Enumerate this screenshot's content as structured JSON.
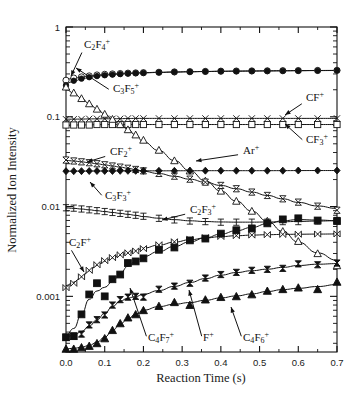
{
  "figure": {
    "background": "#ffffff",
    "ink": "#111111",
    "width": 361,
    "height": 400
  },
  "axes": {
    "x_title": "Reaction Time (s)",
    "y_title": "Normalized Ion Intensity",
    "x_ticklabels": [
      "0.0",
      "0.1",
      "0.2",
      "0.3",
      "0.4",
      "0.5",
      "0.6",
      "0.7"
    ],
    "x_tickvalues": [
      0.0,
      0.1,
      0.2,
      0.3,
      0.4,
      0.5,
      0.6,
      0.7
    ],
    "y_ticklabels": [
      "1",
      "0.1",
      "0.01",
      "0.001"
    ],
    "y_tickvalues": [
      1,
      0.1,
      0.01,
      0.001
    ]
  },
  "chart_data": {
    "type": "scatter",
    "title": "",
    "subtitle": "",
    "xlabel": "Reaction Time (s)",
    "ylabel": "Normalized Ion Intensity",
    "xscale": "linear",
    "yscale": "log",
    "xlim": [
      0.0,
      0.7
    ],
    "ylim": [
      0.00024,
      1.0
    ],
    "grid": false,
    "legend": "none (in-plot annotated labels with leader lines)",
    "annotations": [
      {
        "text": "C2F4+",
        "display": "C₂F₄⁺",
        "points_to_series": "C2F4+"
      },
      {
        "text": "C3F5+",
        "display": "C₃F₅⁺",
        "points_to_series": "C3F5+"
      },
      {
        "text": "CF+",
        "display": "CF⁺",
        "points_to_series": "CF+"
      },
      {
        "text": "CF3+",
        "display": "CF₃⁺",
        "points_to_series": "CF3+"
      },
      {
        "text": "Ar+",
        "display": "Ar⁺",
        "points_to_series": "Ar+"
      },
      {
        "text": "CF2+",
        "display": "CF₂⁺",
        "points_to_series": "CF2+"
      },
      {
        "text": "C3F3+",
        "display": "C₃F₃⁺",
        "points_to_series": "C3F3+"
      },
      {
        "text": "C2F3+",
        "display": "C₂F₃⁺",
        "points_to_series": "C2F3+"
      },
      {
        "text": "C2F+",
        "display": "C₂F⁺",
        "points_to_series": "C2F+"
      },
      {
        "text": "C4F7+",
        "display": "C₄F₇⁺",
        "points_to_series": "C4F7+"
      },
      {
        "text": "F+",
        "display": "F⁺",
        "points_to_series": "F+"
      },
      {
        "text": "C4F6+",
        "display": "C₄F₆⁺",
        "points_to_series": "C4F6+"
      }
    ],
    "series": [
      {
        "name": "C2F4+",
        "label": "C₂F₄⁺",
        "marker": "open-circle",
        "x": [
          0.0,
          0.02,
          0.04,
          0.06,
          0.08,
          0.1,
          0.12,
          0.14,
          0.16,
          0.18,
          0.2,
          0.24,
          0.28,
          0.32,
          0.36,
          0.4,
          0.44,
          0.48,
          0.52,
          0.56,
          0.6,
          0.65,
          0.7
        ],
        "y": [
          0.255,
          0.27,
          0.278,
          0.285,
          0.292,
          0.297,
          0.3,
          0.303,
          0.306,
          0.308,
          0.31,
          0.313,
          0.316,
          0.318,
          0.32,
          0.322,
          0.323,
          0.324,
          0.325,
          0.326,
          0.327,
          0.328,
          0.329
        ]
      },
      {
        "name": "C3F5+",
        "label": "C₃F₅⁺",
        "marker": "filled-circle",
        "x": [
          0.0,
          0.02,
          0.04,
          0.06,
          0.08,
          0.1,
          0.12,
          0.14,
          0.16,
          0.18,
          0.2,
          0.24,
          0.28,
          0.32,
          0.36,
          0.4,
          0.44,
          0.48,
          0.52,
          0.56,
          0.6,
          0.65,
          0.7
        ],
        "y": [
          0.225,
          0.252,
          0.266,
          0.276,
          0.284,
          0.29,
          0.295,
          0.299,
          0.303,
          0.306,
          0.308,
          0.312,
          0.315,
          0.317,
          0.319,
          0.321,
          0.322,
          0.323,
          0.324,
          0.325,
          0.326,
          0.327,
          0.328
        ]
      },
      {
        "name": "CF+",
        "label": "CF⁺",
        "marker": "x-cross",
        "x": [
          0.0,
          0.02,
          0.04,
          0.06,
          0.08,
          0.1,
          0.12,
          0.14,
          0.16,
          0.18,
          0.2,
          0.24,
          0.28,
          0.32,
          0.36,
          0.4,
          0.44,
          0.48,
          0.52,
          0.56,
          0.6,
          0.65,
          0.7
        ],
        "y": [
          0.094,
          0.094,
          0.094,
          0.095,
          0.095,
          0.095,
          0.095,
          0.095,
          0.096,
          0.096,
          0.096,
          0.096,
          0.096,
          0.096,
          0.096,
          0.096,
          0.096,
          0.096,
          0.096,
          0.096,
          0.096,
          0.096,
          0.096
        ]
      },
      {
        "name": "CF3+",
        "label": "CF₃⁺",
        "marker": "open-square",
        "x": [
          0.0,
          0.02,
          0.04,
          0.06,
          0.08,
          0.1,
          0.12,
          0.14,
          0.16,
          0.18,
          0.2,
          0.24,
          0.28,
          0.32,
          0.36,
          0.4,
          0.44,
          0.48,
          0.52,
          0.56,
          0.6,
          0.65,
          0.7
        ],
        "y": [
          0.081,
          0.081,
          0.081,
          0.081,
          0.082,
          0.082,
          0.082,
          0.082,
          0.082,
          0.082,
          0.082,
          0.082,
          0.082,
          0.082,
          0.082,
          0.082,
          0.082,
          0.082,
          0.082,
          0.082,
          0.082,
          0.082,
          0.082
        ]
      },
      {
        "name": "Ar+",
        "label": "Ar⁺",
        "marker": "open-triangle-up",
        "x": [
          0.0,
          0.02,
          0.04,
          0.06,
          0.08,
          0.1,
          0.12,
          0.14,
          0.16,
          0.18,
          0.2,
          0.24,
          0.28,
          0.32,
          0.36,
          0.4,
          0.44,
          0.48,
          0.52,
          0.56,
          0.6,
          0.65,
          0.7
        ],
        "y": [
          0.215,
          0.185,
          0.16,
          0.14,
          0.122,
          0.107,
          0.094,
          0.082,
          0.072,
          0.063,
          0.055,
          0.0425,
          0.0325,
          0.025,
          0.0193,
          0.0149,
          0.0115,
          0.0089,
          0.0069,
          0.0053,
          0.0041,
          0.003,
          0.0022
        ]
      },
      {
        "name": "CF2+",
        "label": "CF₂⁺",
        "marker": "bowtie-open",
        "x": [
          0.0,
          0.02,
          0.04,
          0.06,
          0.08,
          0.1,
          0.12,
          0.14,
          0.16,
          0.18,
          0.2,
          0.24,
          0.28,
          0.32,
          0.36,
          0.4,
          0.44,
          0.48,
          0.52,
          0.56,
          0.6,
          0.65,
          0.7
        ],
        "y": [
          0.033,
          0.0322,
          0.0315,
          0.0308,
          0.03,
          0.0292,
          0.0283,
          0.0275,
          0.0267,
          0.0259,
          0.025,
          0.0234,
          0.0218,
          0.0202,
          0.0187,
          0.0172,
          0.0158,
          0.0145,
          0.0133,
          0.0122,
          0.0112,
          0.0101,
          0.0091
        ]
      },
      {
        "name": "C3F3+",
        "label": "C₃F₃⁺",
        "marker": "filled-diamond",
        "x": [
          0.0,
          0.02,
          0.04,
          0.06,
          0.08,
          0.1,
          0.12,
          0.14,
          0.16,
          0.18,
          0.2,
          0.24,
          0.28,
          0.32,
          0.36,
          0.4,
          0.44,
          0.48,
          0.52,
          0.56,
          0.6,
          0.65,
          0.7
        ],
        "y": [
          0.0248,
          0.0248,
          0.0248,
          0.0249,
          0.0249,
          0.0249,
          0.0249,
          0.025,
          0.025,
          0.025,
          0.025,
          0.025,
          0.025,
          0.0251,
          0.0251,
          0.0251,
          0.0251,
          0.0251,
          0.0251,
          0.0251,
          0.0252,
          0.0252,
          0.0252
        ]
      },
      {
        "name": "C2F3+",
        "label": "C₂F₃⁺",
        "marker": "i-beam",
        "x": [
          0.0,
          0.02,
          0.04,
          0.06,
          0.08,
          0.1,
          0.12,
          0.14,
          0.16,
          0.18,
          0.2,
          0.24,
          0.28,
          0.32,
          0.36,
          0.4,
          0.44,
          0.48,
          0.52,
          0.56,
          0.6,
          0.65,
          0.7
        ],
        "y": [
          0.0097,
          0.0096,
          0.0094,
          0.0092,
          0.009,
          0.0088,
          0.0086,
          0.0084,
          0.0082,
          0.008,
          0.0078,
          0.0074,
          0.0071,
          0.0069,
          0.0068,
          0.0067,
          0.0067,
          0.0067,
          0.0067,
          0.0068,
          0.0068,
          0.0069,
          0.007
        ]
      },
      {
        "name": "C2F+",
        "label": "C₂F⁺",
        "marker": "hourglass-open",
        "x": [
          0.0,
          0.02,
          0.04,
          0.06,
          0.08,
          0.1,
          0.12,
          0.14,
          0.16,
          0.18,
          0.2,
          0.24,
          0.28,
          0.32,
          0.36,
          0.4,
          0.44,
          0.48,
          0.52,
          0.56,
          0.6,
          0.65,
          0.7
        ],
        "y": [
          0.00125,
          0.0014,
          0.00165,
          0.00195,
          0.00225,
          0.0025,
          0.0027,
          0.0029,
          0.00305,
          0.0032,
          0.0034,
          0.00375,
          0.00405,
          0.0043,
          0.0045,
          0.00465,
          0.00475,
          0.00482,
          0.00487,
          0.0049,
          0.00492,
          0.00494,
          0.00496
        ]
      },
      {
        "name": "C4F7+",
        "label": "C₄F₇⁺",
        "marker": "filled-square",
        "x": [
          0.0,
          0.02,
          0.04,
          0.06,
          0.08,
          0.1,
          0.12,
          0.14,
          0.16,
          0.18,
          0.2,
          0.24,
          0.28,
          0.32,
          0.36,
          0.4,
          0.44,
          0.48,
          0.52,
          0.56,
          0.6,
          0.65,
          0.7
        ],
        "y": [
          0.00035,
          0.00036,
          0.00063,
          0.00105,
          0.0014,
          0.001,
          0.00155,
          0.00175,
          0.00235,
          0.00245,
          0.00265,
          0.0033,
          0.0035,
          0.0042,
          0.0044,
          0.005,
          0.00545,
          0.0057,
          0.0065,
          0.0072,
          0.0074,
          0.007,
          0.0069
        ]
      },
      {
        "name": "F+",
        "label": "F⁺",
        "marker": "bowtie-filled",
        "x": [
          0.0,
          0.02,
          0.04,
          0.06,
          0.08,
          0.1,
          0.12,
          0.14,
          0.16,
          0.18,
          0.2,
          0.24,
          0.28,
          0.32,
          0.36,
          0.4,
          0.44,
          0.48,
          0.52,
          0.56,
          0.6,
          0.65,
          0.7
        ],
        "y": [
          0.00035,
          0.00036,
          0.00038,
          0.00048,
          0.00055,
          0.00062,
          0.0008,
          0.00092,
          0.00098,
          0.001,
          0.00098,
          0.0012,
          0.0013,
          0.0014,
          0.0016,
          0.00175,
          0.00185,
          0.00195,
          0.002,
          0.00205,
          0.0023,
          0.00225,
          0.00235
        ]
      },
      {
        "name": "C4F6+",
        "label": "C₄F₆⁺",
        "marker": "filled-triangle-up",
        "x": [
          0.0,
          0.02,
          0.04,
          0.06,
          0.08,
          0.1,
          0.12,
          0.14,
          0.16,
          0.18,
          0.2,
          0.24,
          0.28,
          0.32,
          0.36,
          0.4,
          0.44,
          0.48,
          0.52,
          0.56,
          0.6,
          0.65,
          0.7
        ],
        "y": [
          0.00026,
          0.00026,
          0.00027,
          0.00028,
          0.0003,
          0.00034,
          0.00042,
          0.0005,
          0.00058,
          0.00063,
          0.0007,
          0.00078,
          0.00086,
          0.0008,
          0.00092,
          0.00098,
          0.001,
          0.00105,
          0.00115,
          0.0012,
          0.00125,
          0.0012,
          0.00145
        ]
      }
    ]
  }
}
